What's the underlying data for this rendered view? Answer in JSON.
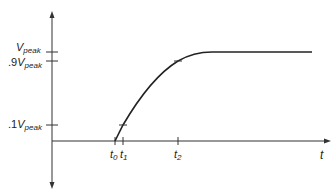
{
  "diagram": {
    "title": "",
    "type": "rise-time waveform",
    "x_axis": {
      "label": "t"
    },
    "y_levels": [
      {
        "id": "vpeak",
        "prefix": "",
        "symbol": "V",
        "subscript": "peak",
        "y": 52
      },
      {
        "id": "v90",
        "prefix": ".9",
        "symbol": "V",
        "subscript": "peak",
        "y": 61
      },
      {
        "id": "v10",
        "prefix": ".1",
        "symbol": "V",
        "subscript": "peak",
        "y": 125
      }
    ],
    "t_marks": [
      {
        "id": "t0",
        "symbol": "t",
        "subscript": "0",
        "x": 115
      },
      {
        "id": "t1",
        "symbol": "t",
        "subscript": "1",
        "x": 123
      },
      {
        "id": "t2",
        "symbol": "t",
        "subscript": "2",
        "x": 178
      }
    ],
    "colors": {
      "line": "#222222",
      "axis": "#333333",
      "background": "#ffffff"
    }
  }
}
